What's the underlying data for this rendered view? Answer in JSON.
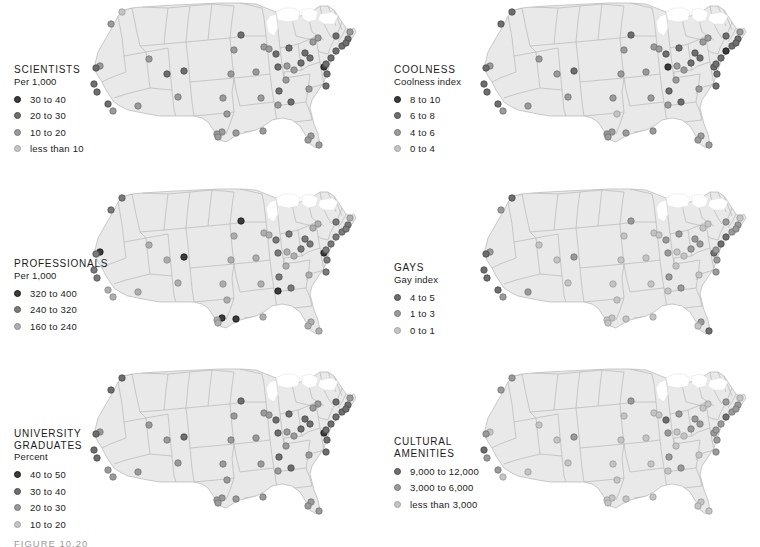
{
  "figure": {
    "caption": "FIGURE 10.20",
    "page_background": "#ffffff",
    "map_fill": "#e9e9e9",
    "map_border": "#b4b4b4",
    "lakes_fill": "#f4f4f4"
  },
  "chart_data": {
    "type": "map",
    "layout": "2 columns x 3 rows of small-multiple US maps",
    "shared_geography": "Contiguous United States with state boundaries; one graduated-symbol dot per metropolitan area",
    "panels": [
      {
        "id": "scientists",
        "title": "SCIENTISTS",
        "subtitle": "Per 1,000",
        "legend": [
          {
            "label": "30 to 40",
            "color": "#3b3b3b"
          },
          {
            "label": "20 to 30",
            "color": "#6e6e6e"
          },
          {
            "label": "10 to 20",
            "color": "#9a9a9a"
          },
          {
            "label": "less than 10",
            "color": "#c4c4c4"
          }
        ]
      },
      {
        "id": "coolness",
        "title": "COOLNESS",
        "subtitle": "Coolness index",
        "legend": [
          {
            "label": "8 to 10",
            "color": "#3b3b3b"
          },
          {
            "label": "6 to 8",
            "color": "#6e6e6e"
          },
          {
            "label": "4 to 6",
            "color": "#9a9a9a"
          },
          {
            "label": "0 to 4",
            "color": "#c4c4c4"
          }
        ]
      },
      {
        "id": "professionals",
        "title": "PROFESSIONALS",
        "subtitle": "Per 1,000",
        "legend": [
          {
            "label": "320 to 400",
            "color": "#3b3b3b"
          },
          {
            "label": "240 to 320",
            "color": "#7a7a7a"
          },
          {
            "label": "160 to 240",
            "color": "#aeaeae"
          }
        ]
      },
      {
        "id": "gays",
        "title": "GAYS",
        "subtitle": "Gay index",
        "legend": [
          {
            "label": "4 to 5",
            "color": "#6e6e6e"
          },
          {
            "label": "1 to 3",
            "color": "#9a9a9a"
          },
          {
            "label": "0 to 1",
            "color": "#c4c4c4"
          }
        ]
      },
      {
        "id": "university-graduates",
        "title": "UNIVERSITY\nGRADUATES",
        "subtitle": "Percent",
        "legend": [
          {
            "label": "40 to 50",
            "color": "#3b3b3b"
          },
          {
            "label": "30 to 40",
            "color": "#6e6e6e"
          },
          {
            "label": "20 to 30",
            "color": "#9a9a9a"
          },
          {
            "label": "10 to 20",
            "color": "#c4c4c4"
          }
        ]
      },
      {
        "id": "cultural-amenities",
        "title": "CULTURAL\nAMENITIES",
        "subtitle": "",
        "legend": [
          {
            "label": "9,000 to 12,000",
            "color": "#6e6e6e"
          },
          {
            "label": "3,000 to 6,000",
            "color": "#9a9a9a"
          },
          {
            "label": "less than 3,000",
            "color": "#c4c4c4"
          }
        ]
      }
    ],
    "points": {
      "coordinate_space": "SVG viewBox 0 0 380 182 per panel",
      "cities": [
        {
          "name": "Seattle",
          "x": 42,
          "y": 18
        },
        {
          "name": "Portland",
          "x": 31,
          "y": 30
        },
        {
          "name": "Boise",
          "x": 69,
          "y": 65
        },
        {
          "name": "Salt Lake City",
          "x": 87,
          "y": 80
        },
        {
          "name": "Reno",
          "x": 20,
          "y": 72
        },
        {
          "name": "Sacramento",
          "x": 16,
          "y": 74
        },
        {
          "name": "San Francisco",
          "x": 14,
          "y": 90
        },
        {
          "name": "San Jose",
          "x": 17,
          "y": 98
        },
        {
          "name": "Los Angeles",
          "x": 28,
          "y": 110
        },
        {
          "name": "San Diego",
          "x": 33,
          "y": 117
        },
        {
          "name": "Phoenix",
          "x": 58,
          "y": 112
        },
        {
          "name": "Denver",
          "x": 104,
          "y": 77
        },
        {
          "name": "Albuquerque",
          "x": 98,
          "y": 103
        },
        {
          "name": "Wichita",
          "x": 143,
          "y": 104
        },
        {
          "name": "Oklahoma City",
          "x": 147,
          "y": 120
        },
        {
          "name": "Dallas",
          "x": 142,
          "y": 138
        },
        {
          "name": "Fort Worth",
          "x": 137,
          "y": 140
        },
        {
          "name": "Houston",
          "x": 156,
          "y": 139
        },
        {
          "name": "San Antonio",
          "x": 138,
          "y": 143
        },
        {
          "name": "Austin",
          "x": 151,
          "y": 80
        },
        {
          "name": "Minneapolis",
          "x": 161,
          "y": 41
        },
        {
          "name": "Des Moines",
          "x": 176,
          "y": 78
        },
        {
          "name": "Omaha",
          "x": 154,
          "y": 56
        },
        {
          "name": "Kansas City",
          "x": 184,
          "y": 53
        },
        {
          "name": "St. Louis",
          "x": 198,
          "y": 73
        },
        {
          "name": "Milwaukee",
          "x": 189,
          "y": 55
        },
        {
          "name": "Chicago",
          "x": 196,
          "y": 60
        },
        {
          "name": "Indianapolis",
          "x": 207,
          "y": 72
        },
        {
          "name": "Detroit",
          "x": 209,
          "y": 54
        },
        {
          "name": "Columbus",
          "x": 221,
          "y": 69
        },
        {
          "name": "Cleveland",
          "x": 225,
          "y": 59
        },
        {
          "name": "Cincinnati",
          "x": 214,
          "y": 76
        },
        {
          "name": "Louisville",
          "x": 206,
          "y": 86
        },
        {
          "name": "Nashville",
          "x": 199,
          "y": 97
        },
        {
          "name": "Memphis",
          "x": 181,
          "y": 104
        },
        {
          "name": "Birmingham",
          "x": 198,
          "y": 111
        },
        {
          "name": "Atlanta",
          "x": 211,
          "y": 108
        },
        {
          "name": "New Orleans",
          "x": 183,
          "y": 137
        },
        {
          "name": "Tampa",
          "x": 231,
          "y": 142
        },
        {
          "name": "Miami",
          "x": 239,
          "y": 151
        },
        {
          "name": "Jacksonville",
          "x": 228,
          "y": 146
        },
        {
          "name": "Charlotte",
          "x": 229,
          "y": 95
        },
        {
          "name": "Raleigh",
          "x": 246,
          "y": 92
        },
        {
          "name": "Richmond",
          "x": 247,
          "y": 80
        },
        {
          "name": "Washington DC",
          "x": 244,
          "y": 73
        },
        {
          "name": "Baltimore",
          "x": 246,
          "y": 70
        },
        {
          "name": "Philadelphia",
          "x": 251,
          "y": 64
        },
        {
          "name": "New York",
          "x": 256,
          "y": 57
        },
        {
          "name": "Hartford",
          "x": 262,
          "y": 52
        },
        {
          "name": "Boston",
          "x": 268,
          "y": 45
        },
        {
          "name": "Providence",
          "x": 266,
          "y": 49
        },
        {
          "name": "Pittsburgh",
          "x": 230,
          "y": 64
        },
        {
          "name": "Buffalo",
          "x": 233,
          "y": 48
        },
        {
          "name": "Rochester",
          "x": 238,
          "y": 44
        },
        {
          "name": "Albany",
          "x": 256,
          "y": 42
        },
        {
          "name": "Portland ME",
          "x": 270,
          "y": 38
        }
      ]
    }
  }
}
